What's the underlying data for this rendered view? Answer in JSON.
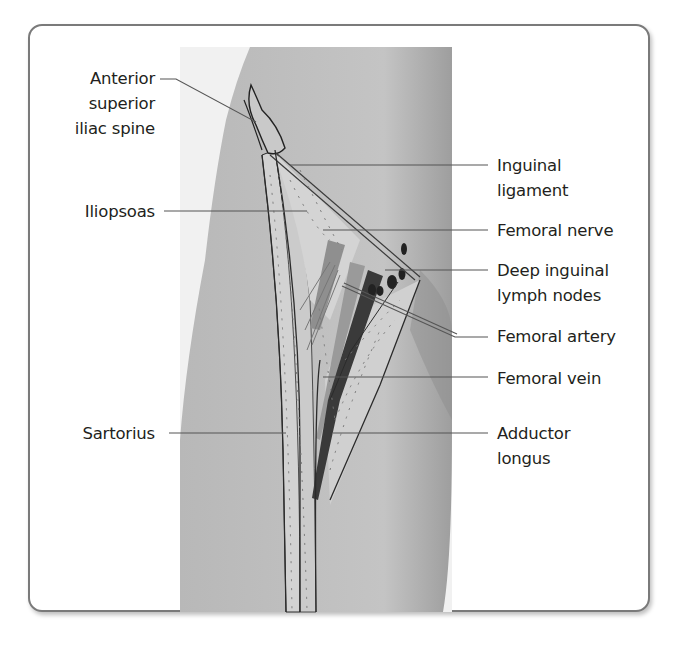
{
  "figure": {
    "colors": {
      "panel_border": "#7a7a7a",
      "skin": "#bdbdbd",
      "skin_edge": "#a9a9a9",
      "muscle_light": "#cfcfcf",
      "vessel_dark": "#3a3a3a",
      "leader_line": "#555555",
      "text": "#231f20"
    },
    "labels_left": [
      {
        "id": "asis",
        "text": "Anterior\nsuperior\niliac spine"
      },
      {
        "id": "iliopsoas",
        "text": "Iliopsoas"
      },
      {
        "id": "sartorius",
        "text": "Sartorius"
      }
    ],
    "labels_right": [
      {
        "id": "inguinal-ligament",
        "text": "Inguinal\nligament"
      },
      {
        "id": "femoral-nerve",
        "text": "Femoral nerve"
      },
      {
        "id": "deep-inguinal-lymph-nodes",
        "text": "Deep inguinal\nlymph nodes"
      },
      {
        "id": "femoral-artery",
        "text": "Femoral artery"
      },
      {
        "id": "femoral-vein",
        "text": "Femoral vein"
      },
      {
        "id": "adductor-longus",
        "text": "Adductor\nlongus"
      }
    ]
  }
}
